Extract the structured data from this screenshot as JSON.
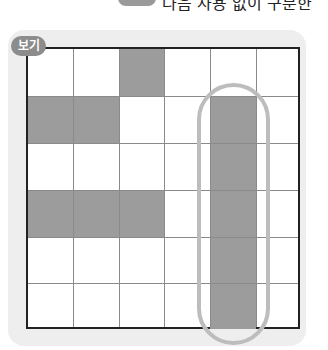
{
  "header": {
    "number_badge": "",
    "instruction_text": "다음 사용 없이 구분한"
  },
  "example": {
    "label": "보기",
    "grid": {
      "rows": 6,
      "cols": 6,
      "shaded_cells": [
        [
          0,
          2
        ],
        [
          1,
          0
        ],
        [
          1,
          1
        ],
        [
          3,
          0
        ],
        [
          3,
          1
        ],
        [
          3,
          2
        ],
        [
          1,
          4
        ],
        [
          2,
          4
        ],
        [
          3,
          4
        ],
        [
          4,
          4
        ],
        [
          5,
          4
        ]
      ],
      "highlight": {
        "shape": "capsule",
        "column": 4,
        "rows": [
          1,
          5
        ]
      }
    },
    "colors": {
      "panel": "#eeeeee",
      "shade": "#9c9c9c",
      "border": "#222222",
      "gridline": "#8a8a8a",
      "capsule": "#bdbdbd",
      "tag": "#8c8c8c"
    }
  }
}
